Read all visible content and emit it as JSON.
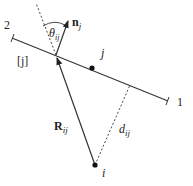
{
  "diagram": {
    "type": "geometry",
    "colors": {
      "stroke": "#333333",
      "text": "#222222",
      "background": "#ffffff"
    },
    "segment": {
      "label_end_1": "1",
      "label_end_2": "2",
      "segment_label": "[j]"
    },
    "points": {
      "j": {
        "label": "j"
      },
      "i": {
        "label": "i"
      }
    },
    "vectors": {
      "normal": {
        "label_main": "n",
        "label_sub": "j"
      },
      "R": {
        "label_main": "R",
        "label_sub": "ij"
      }
    },
    "angle": {
      "label_main": "θ",
      "label_sub": "ij"
    },
    "distance": {
      "label_main": "d",
      "label_sub": "ij"
    }
  }
}
